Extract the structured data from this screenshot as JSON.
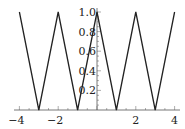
{
  "chart_data": {
    "type": "line",
    "title": "",
    "xlabel": "",
    "ylabel": "",
    "xlim": [
      -4,
      4
    ],
    "ylim": [
      0,
      1
    ],
    "grid": false,
    "legend": null,
    "x_ticks": [
      -4,
      -2,
      2,
      4
    ],
    "x_tick_labels": [
      "-4",
      "-2",
      "2",
      "4"
    ],
    "y_ticks": [
      0.2,
      0.4,
      0.6,
      0.8,
      1.0
    ],
    "y_tick_labels": [
      "0.2",
      "0.4",
      "0.6",
      "0.8",
      "1.0"
    ],
    "series": [
      {
        "name": "triangle wave",
        "color": "#222222",
        "x": [
          -4,
          -3,
          -2,
          -1,
          0,
          1,
          2,
          3,
          4
        ],
        "y": [
          1,
          0,
          1,
          0,
          1,
          0,
          1,
          0,
          1
        ]
      }
    ]
  }
}
